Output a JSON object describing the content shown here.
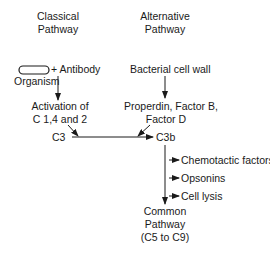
{
  "diagram": {
    "classical": {
      "heading_line1": "Classical",
      "heading_line2": "Pathway",
      "plus_antibody": "+ Antibody",
      "organism": "Organism",
      "activation_line1": "Activation of",
      "activation_line2": "C 1,4 and 2",
      "c3": "C3"
    },
    "alternative": {
      "heading_line1": "Alternative",
      "heading_line2": "Pathway",
      "trigger": "Bacterial cell wall",
      "factors_line1": "Properdin, Factor B,",
      "factors_line2": "Factor D"
    },
    "c3b": "C3b",
    "effects": [
      "Chemotactic factors",
      "Opsonins",
      "Cell lysis"
    ],
    "common": {
      "line1": "Common",
      "line2": "Pathway",
      "line3": "(C5 to C9)"
    },
    "colors": {
      "ink": "#1a1a1a",
      "background": "#ffffff"
    }
  }
}
